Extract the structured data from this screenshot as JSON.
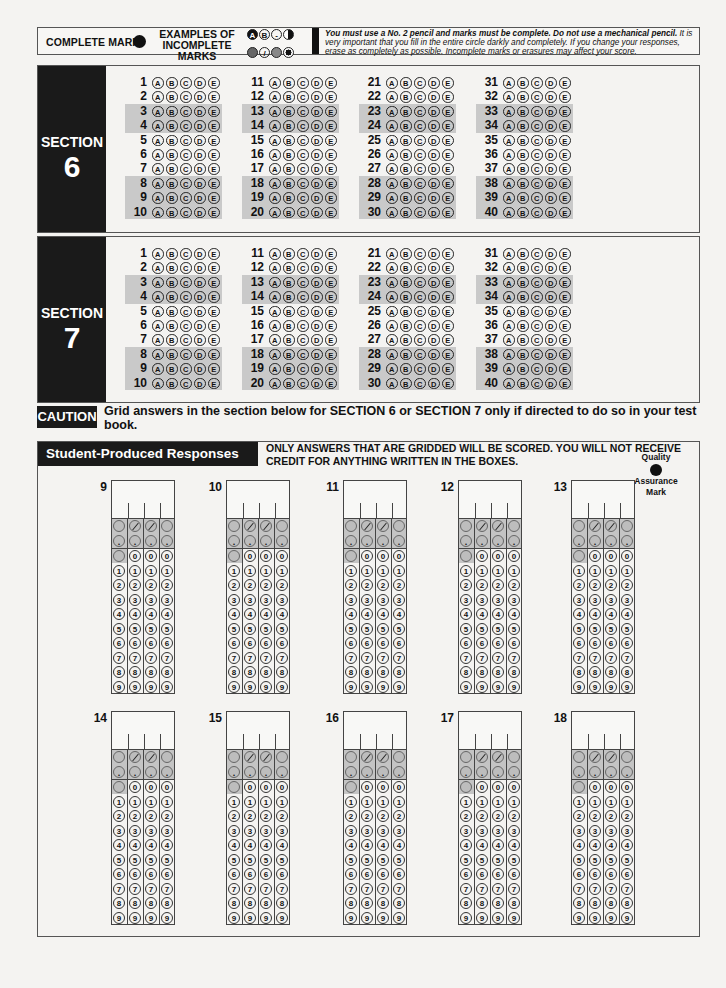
{
  "header": {
    "complete_mark_label": "COMPLETE MARK",
    "incomplete_label_line1": "EXAMPLES OF",
    "incomplete_label_line2": "INCOMPLETE MARKS",
    "incomplete_examples": [
      "A",
      "B",
      "-",
      "F",
      "#",
      "/",
      "@",
      "o"
    ],
    "instructions_bold": "You must use a No. 2 pencil and marks must be complete. Do not use a mechanical pencil.",
    "instructions_rest": " It is very important that you fill in the entire circle darkly and completely. If you change your responses, erase as completely as possible. Incomplete marks or erasures may affect your score."
  },
  "choices": [
    "A",
    "B",
    "C",
    "D",
    "E"
  ],
  "sections": [
    {
      "label": "SECTION",
      "number": "6",
      "columns": [
        {
          "questions": [
            "1",
            "2",
            "3",
            "4",
            "5",
            "6",
            "7",
            "8",
            "9",
            "10"
          ]
        },
        {
          "questions": [
            "11",
            "12",
            "13",
            "14",
            "15",
            "16",
            "17",
            "18",
            "19",
            "20"
          ]
        },
        {
          "questions": [
            "21",
            "22",
            "23",
            "24",
            "25",
            "26",
            "27",
            "28",
            "29",
            "30"
          ]
        },
        {
          "questions": [
            "31",
            "32",
            "33",
            "34",
            "35",
            "36",
            "37",
            "38",
            "39",
            "40"
          ]
        }
      ]
    },
    {
      "label": "SECTION",
      "number": "7",
      "columns": [
        {
          "questions": [
            "1",
            "2",
            "3",
            "4",
            "5",
            "6",
            "7",
            "8",
            "9",
            "10"
          ]
        },
        {
          "questions": [
            "11",
            "12",
            "13",
            "14",
            "15",
            "16",
            "17",
            "18",
            "19",
            "20"
          ]
        },
        {
          "questions": [
            "21",
            "22",
            "23",
            "24",
            "25",
            "26",
            "27",
            "28",
            "29",
            "30"
          ]
        },
        {
          "questions": [
            "31",
            "32",
            "33",
            "34",
            "35",
            "36",
            "37",
            "38",
            "39",
            "40"
          ]
        }
      ]
    }
  ],
  "shaded_row_indices": [
    2,
    3,
    7,
    8,
    9
  ],
  "caution": {
    "label": "CAUTION",
    "text": "Grid answers in the section below for SECTION 6 or SECTION 7 only if directed to do so in your test book."
  },
  "student_produced": {
    "title": "Student-Produced Responses",
    "note": "ONLY ANSWERS THAT ARE GRIDDED WILL BE SCORED. YOU WILL NOT RECEIVE CREDIT FOR ANYTHING WRITTEN IN THE BOXES.",
    "qa_line1": "Quality",
    "qa_line2": "Assurance",
    "qa_line3": "Mark",
    "grids": [
      "9",
      "10",
      "11",
      "12",
      "13",
      "14",
      "15",
      "16",
      "17",
      "18"
    ],
    "digits": [
      "0",
      "1",
      "2",
      "3",
      "4",
      "5",
      "6",
      "7",
      "8",
      "9"
    ],
    "decimal_symbol": "."
  }
}
